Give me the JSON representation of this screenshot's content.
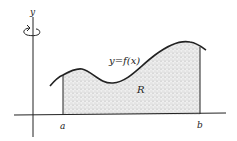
{
  "diagram": {
    "type": "region-under-curve-revolution",
    "labels": {
      "y_axis": "y",
      "curve": "y=f(x)",
      "region": "R",
      "a": "a",
      "b": "b"
    },
    "icons": {
      "rotation": "rotation-arrow-icon"
    },
    "colors": {
      "stroke": "#222222",
      "fill": "#d8d8d8",
      "background": "#ffffff"
    }
  }
}
